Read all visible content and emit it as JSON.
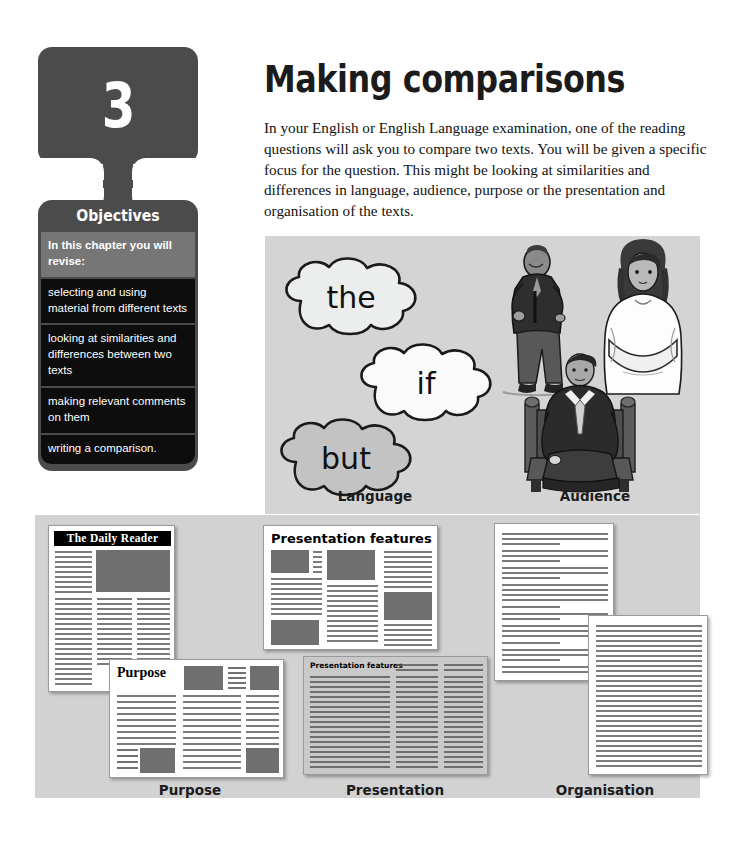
{
  "chapter": {
    "number": "3",
    "objectives_title": "Objectives",
    "intro": "In this chapter you will revise:",
    "items": [
      "selecting and using material from different texts",
      "looking at similarities and differences between two texts",
      "making relevant comments on them",
      "writing a comparison."
    ]
  },
  "header": {
    "title": "Making comparisons",
    "paragraph": "In your English or English Language examination, one of the reading questions will ask you to compare two texts. You will be given a specific focus for the question. This might be looking at similarities and differences in language, audience, purpose or the presentation and organisation of the texts."
  },
  "illustration_panel": {
    "clouds": [
      {
        "word": "the"
      },
      {
        "word": "if"
      },
      {
        "word": "but"
      }
    ],
    "captions": {
      "language": "Language",
      "audience": "Audience"
    },
    "figures": [
      "elderly-man-standing-figure",
      "young-woman-arms-crossed-figure",
      "seated-man-in-suit-figure"
    ]
  },
  "documents_panel": {
    "captions": {
      "purpose": "Purpose",
      "presentation": "Presentation",
      "organisation": "Organisation"
    },
    "documents": {
      "newspaper_masthead": "The Daily Reader",
      "purpose_headline": "Purpose",
      "presentation_headline": "Presentation features",
      "presentation_table_headline": "Presentation features"
    }
  },
  "colors": {
    "chapter_tab": "#4b4b4b",
    "objectives_intro_band": "#767676",
    "objectives_item": "#0d0d0d",
    "illustration_panel_bg": "#d4d4d4",
    "documents_panel_bg": "#d2d2d2",
    "photo_block": "#6f6f6f",
    "page_bg": "#ffffff"
  }
}
